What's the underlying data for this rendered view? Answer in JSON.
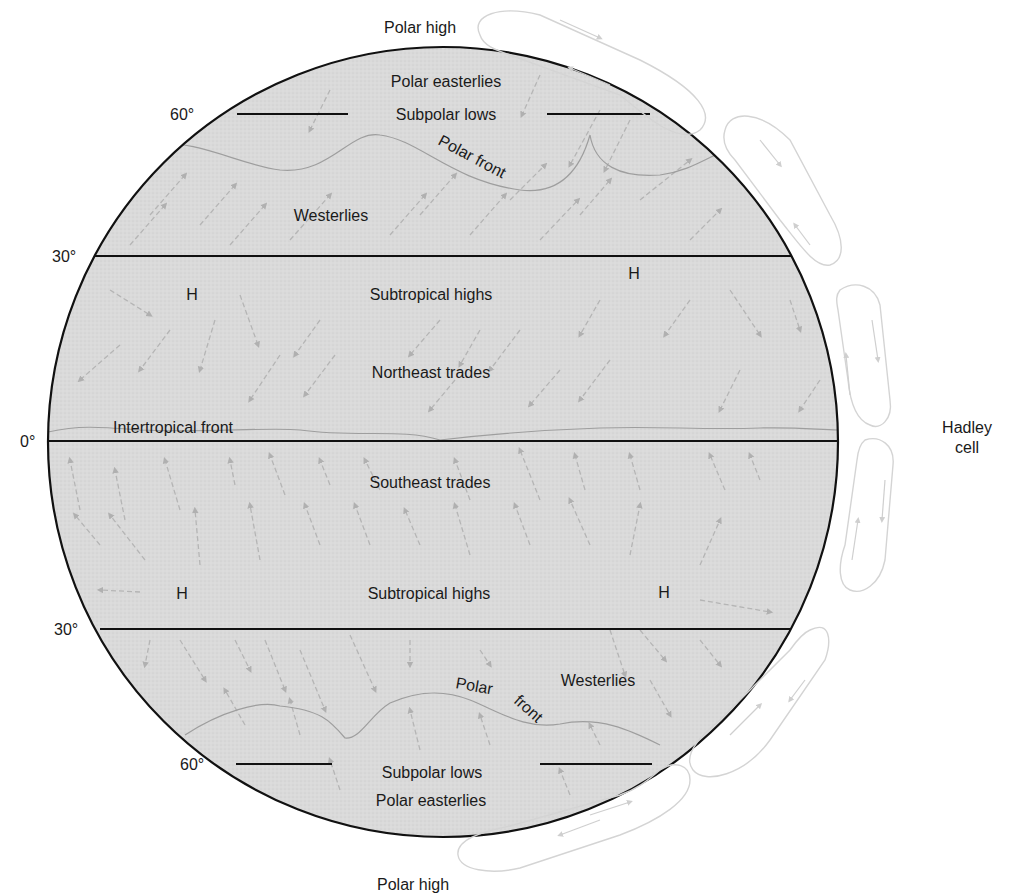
{
  "labels": {
    "polar_high_top": "Polar high",
    "polar_high_bottom": "Polar high",
    "hadley_line1": "Hadley",
    "hadley_line2": "cell"
  },
  "latitudes": {
    "n60": "60°",
    "n30": "30°",
    "eq": "0°",
    "s30": "30°",
    "s60": "60°"
  },
  "zones": {
    "n_polar_easterlies": "Polar easterlies",
    "n_subpolar_lows": "Subpolar lows",
    "n_polar_front": "Polar front",
    "n_westerlies": "Westerlies",
    "n_high_left": "H",
    "n_high_right": "H",
    "n_subtropical_highs": "Subtropical highs",
    "northeast_trades": "Northeast trades",
    "intertropical_front": "Intertropical front",
    "southeast_trades": "Southeast trades",
    "s_high_left": "H",
    "s_high_right": "H",
    "s_subtropical_highs": "Subtropical highs",
    "s_westerlies": "Westerlies",
    "s_polar_front_1": "Polar",
    "s_polar_front_2": "front",
    "s_subpolar_lows": "Subpolar lows",
    "s_polar_easterlies": "Polar easterlies"
  },
  "colors": {
    "globe_fill": "#d9d9d9",
    "outline": "#111111",
    "arrow": "#b3b3b3",
    "cell_loop": "#d6d6d6",
    "front_line": "#9a9a9a"
  }
}
